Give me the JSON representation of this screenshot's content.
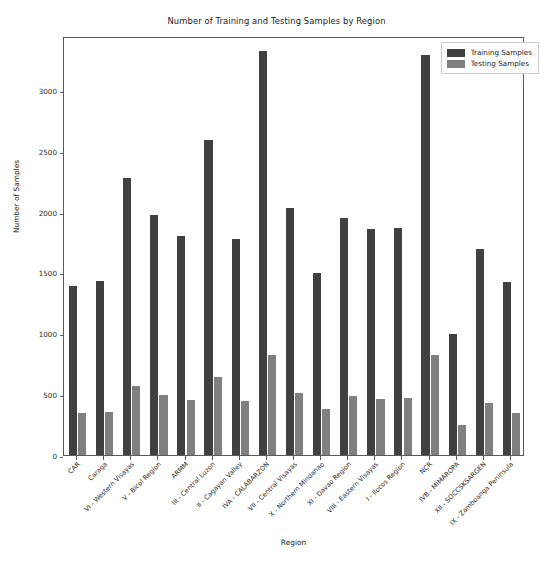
{
  "chart_data": {
    "type": "bar",
    "title": "Number of Training and Testing Samples by Region",
    "xlabel": "Region",
    "ylabel": "Number of Samples",
    "ylim": [
      0,
      3450
    ],
    "yticks": [
      0,
      500,
      1000,
      1500,
      2000,
      2500,
      3000
    ],
    "ytick_labels": [
      "0",
      "500",
      "1000",
      "1500",
      "2000",
      "2500",
      "3000"
    ],
    "grid": false,
    "legend_position": "upper right",
    "categories": [
      "CAR",
      "Caraga",
      "VI - Western Visayas",
      "V - Bicol Region",
      "ARMM",
      "III - Central Luzon",
      "II - Cagayan Valley",
      "IVA - CALABARZON",
      "VII - Central Visayas",
      "X - Northern Mindanao",
      "XI - Davao Region",
      "VIII - Eastern Visayas",
      "I - Ilocos Region",
      "NCR",
      "IVB - MIMAROPA",
      "XII - SOCCSKSARGEN",
      "IX - Zamboanga Peninsula"
    ],
    "series": [
      {
        "name": "Training Samples",
        "color": "#404040",
        "values": [
          1390,
          1430,
          2280,
          1980,
          1800,
          2590,
          1775,
          3325,
          2030,
          1500,
          1950,
          1860,
          1870,
          3290,
          1000,
          1695,
          1425
        ]
      },
      {
        "name": "Testing Samples",
        "color": "#808080",
        "values": [
          350,
          355,
          565,
          495,
          450,
          640,
          445,
          825,
          510,
          380,
          490,
          465,
          470,
          820,
          250,
          425,
          350
        ]
      }
    ]
  },
  "legend": {
    "entries": [
      {
        "label": "Training Samples"
      },
      {
        "label": "Testing Samples"
      }
    ]
  },
  "colors": {
    "training": "#404040",
    "testing": "#808080",
    "axis": "#5a5a5a",
    "text": "#1a1a1a",
    "background": "#ffffff"
  }
}
